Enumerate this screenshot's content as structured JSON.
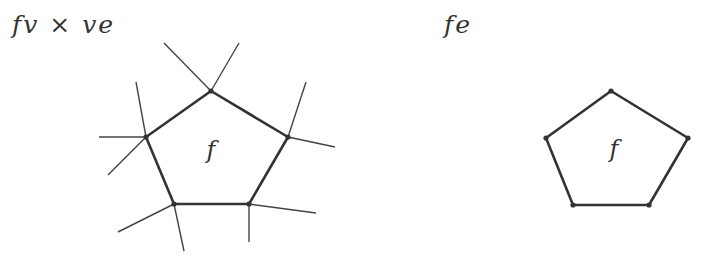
{
  "panels": [
    {
      "id": "left",
      "title": "fv × ve",
      "face_label": "f",
      "pentagon": [
        [
          211,
          91
        ],
        [
          288,
          137
        ],
        [
          249,
          204
        ],
        [
          174,
          204
        ],
        [
          146,
          137
        ]
      ],
      "edges": [
        [
          [
            211,
            91
          ],
          [
            164,
            43
          ]
        ],
        [
          [
            211,
            91
          ],
          [
            239,
            43
          ]
        ],
        [
          [
            288,
            137
          ],
          [
            306,
            82
          ]
        ],
        [
          [
            288,
            137
          ],
          [
            335,
            147
          ]
        ],
        [
          [
            249,
            204
          ],
          [
            316,
            213
          ]
        ],
        [
          [
            249,
            204
          ],
          [
            249,
            242
          ]
        ],
        [
          [
            174,
            204
          ],
          [
            118,
            232
          ]
        ],
        [
          [
            174,
            204
          ],
          [
            184,
            251
          ]
        ],
        [
          [
            146,
            137
          ],
          [
            108,
            175
          ]
        ],
        [
          [
            146,
            137
          ],
          [
            99,
            137
          ]
        ],
        [
          [
            146,
            137
          ],
          [
            136,
            82
          ]
        ]
      ]
    },
    {
      "id": "right",
      "title": "fe",
      "face_label": "f",
      "pentagon": [
        [
          611,
          91
        ],
        [
          688,
          138
        ],
        [
          649,
          205
        ],
        [
          573,
          205
        ],
        [
          546,
          138
        ]
      ],
      "edges": []
    }
  ],
  "colors": {
    "stroke": "#333333",
    "thin_stroke": "#444444",
    "background": "#ffffff"
  }
}
